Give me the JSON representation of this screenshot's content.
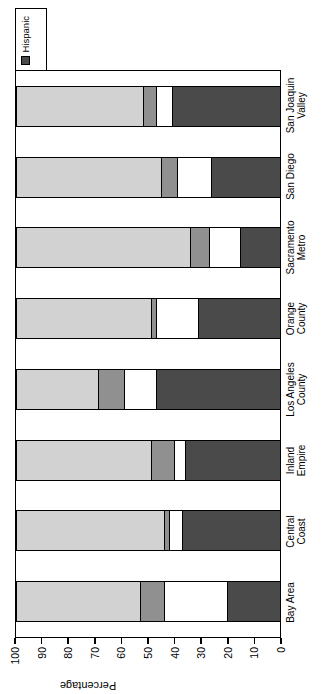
{
  "chart_data": {
    "type": "bar",
    "subtype": "stacked-bar-100",
    "title": "",
    "xlabel": "",
    "ylabel": "Percentage",
    "ylim": [
      0,
      100
    ],
    "yticks": [
      0,
      10,
      20,
      30,
      40,
      50,
      60,
      70,
      80,
      90,
      100
    ],
    "grid": false,
    "orientation": "vertical",
    "legend_position": "top-right",
    "categories": [
      "Bay Area",
      "Central\nCoast",
      "Inland\nEmpire",
      "Los Angeles\nCounty",
      "Orange\nCounty",
      "Sacramento\nMetro",
      "San Diego",
      "San Joaquin\nValley"
    ],
    "series": [
      {
        "name": "White",
        "color": "#d2d2d2",
        "values": [
          47,
          56,
          51,
          31,
          51,
          66,
          55,
          48
        ]
      },
      {
        "name": "Black",
        "color": "#909090",
        "values": [
          9,
          2,
          9,
          10,
          2,
          7,
          6,
          5
        ]
      },
      {
        "name": "Asian",
        "color": "#ffffff",
        "values": [
          24,
          5,
          4,
          12,
          16,
          12,
          13,
          6
        ]
      },
      {
        "name": "American Indian",
        "color": "#000000",
        "values": [
          0,
          0,
          0,
          0,
          0,
          0,
          0,
          0
        ]
      },
      {
        "name": "Hispanic",
        "color": "#4a4a4a",
        "values": [
          20,
          37,
          36,
          47,
          31,
          15,
          26,
          41
        ]
      }
    ]
  },
  "legend": {
    "items": [
      {
        "label": "White",
        "color": "#d2d2d2"
      },
      {
        "label": "Black",
        "color": "#909090"
      },
      {
        "label": "Asian",
        "color": "#ffffff"
      },
      {
        "label": "American\nIndian",
        "color": "#000000"
      },
      {
        "label": "Hispanic",
        "color": "#4a4a4a"
      }
    ]
  },
  "axis": {
    "y_title": "Percentage",
    "y_tick_labels": [
      "0",
      "10",
      "20",
      "30",
      "40",
      "50",
      "60",
      "70",
      "80",
      "90",
      "100"
    ]
  }
}
